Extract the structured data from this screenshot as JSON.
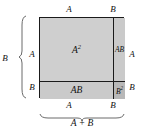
{
  "diagram": {
    "colors": {
      "outline": "#1a1a1a",
      "fill_a2": "#cfcfcf",
      "fill_ab": "#cacaca",
      "fill_b2": "#b8b8b8",
      "background": "#ffffff",
      "text": "#111111"
    },
    "regions": [
      {
        "name": "a-squared",
        "label": "A",
        "exponent": "2"
      },
      {
        "name": "ab-right",
        "label": "AB",
        "exponent": ""
      },
      {
        "name": "ab-bottom",
        "label": "AB",
        "exponent": ""
      },
      {
        "name": "b-squared",
        "label": "B",
        "exponent": "2"
      }
    ],
    "dimensions": {
      "top_left": "A",
      "top_right": "B",
      "left_upper": "A",
      "left_lower": "B",
      "right_upper": "A",
      "right_lower": "B",
      "bottom_left": "A",
      "bottom_right": "B"
    },
    "braces": {
      "left_label": "+ B",
      "bottom_label": "A + B"
    }
  }
}
